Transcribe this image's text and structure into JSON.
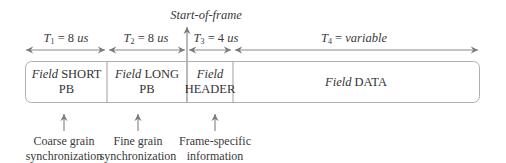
{
  "diagram": {
    "start_marker": "Start-of-frame",
    "timings": [
      {
        "symbol": "T",
        "sub": "1",
        "eq": " = 8 ",
        "unit": "us"
      },
      {
        "symbol": "T",
        "sub": "2",
        "eq": " = 8 ",
        "unit": "us"
      },
      {
        "symbol": "T",
        "sub": "3",
        "eq": " = 4 ",
        "unit": "us"
      },
      {
        "symbol": "T",
        "sub": "4",
        "eq": " = ",
        "unit": "variable"
      }
    ],
    "fields": [
      {
        "prefix": "Field",
        "name": "SHORT PB"
      },
      {
        "prefix": "Field",
        "name": "LONG PB"
      },
      {
        "prefix": "Field",
        "name": "HEADER"
      },
      {
        "prefix": "Field",
        "name": "DATA"
      }
    ],
    "annotations": [
      {
        "line1": "Coarse grain",
        "line2": "synchronization"
      },
      {
        "line1": "Fine grain",
        "line2": "synchronization"
      },
      {
        "line1": "Frame-specific",
        "line2": "information"
      }
    ],
    "colors": {
      "line": "#8a8a8a",
      "text": "#333333",
      "box": "#b0b0b0"
    }
  }
}
